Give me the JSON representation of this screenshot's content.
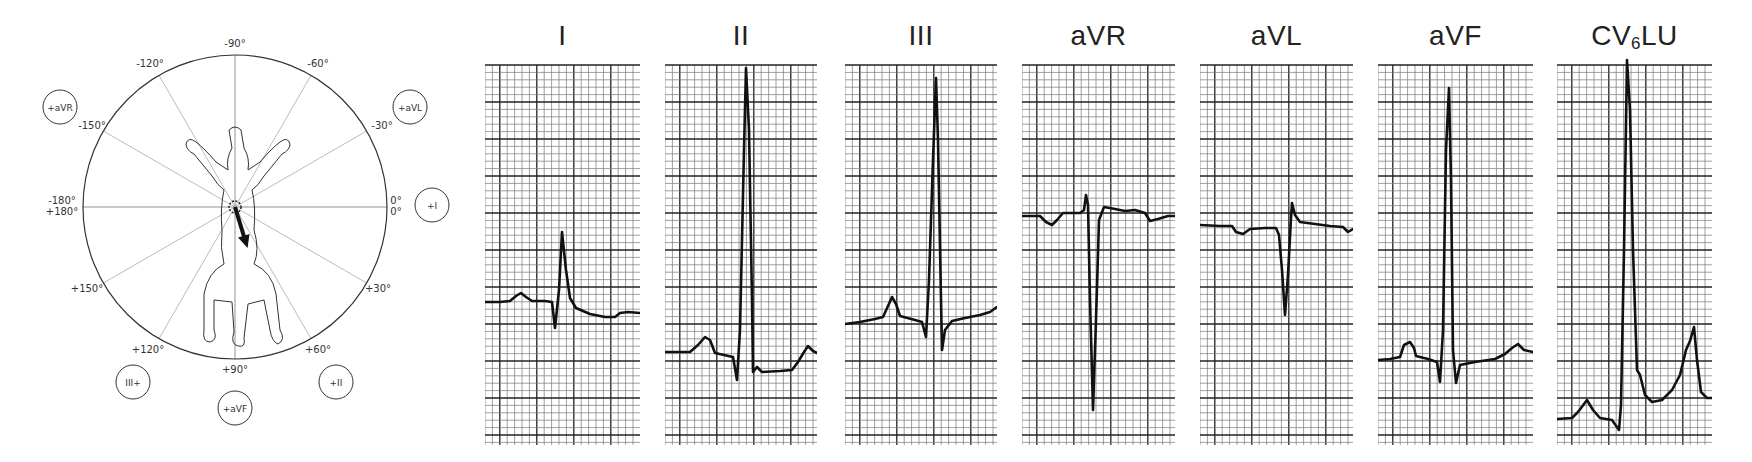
{
  "figure": {
    "type": "canine ECG frontal-plane hexaxial lead system with limb & chest lead tracings",
    "colors": {
      "ink": "#1a1a1a",
      "grid_minor": "#6b6b6b",
      "grid_major": "#2a2a2a",
      "spokes": "#9a9a9a",
      "background": "#ffffff"
    }
  },
  "hexaxial": {
    "center": [
      235,
      207
    ],
    "radius": 152,
    "angle_labels": [
      {
        "text": "-90°",
        "x": 235,
        "y": 47
      },
      {
        "text": "-120°",
        "x": 150,
        "y": 67
      },
      {
        "text": "-60°",
        "x": 318,
        "y": 67
      },
      {
        "text": "-150°",
        "x": 92,
        "y": 129
      },
      {
        "text": "-30°",
        "x": 382,
        "y": 129
      },
      {
        "text": "-180°",
        "x": 62,
        "y": 204
      },
      {
        "text": "+180°",
        "x": 62,
        "y": 215
      },
      {
        "text": "0°",
        "x": 396,
        "y": 204
      },
      {
        "text": "0°",
        "x": 396,
        "y": 215
      },
      {
        "text": "+150°",
        "x": 87,
        "y": 292
      },
      {
        "text": "+30°",
        "x": 378,
        "y": 292
      },
      {
        "text": "+120°",
        "x": 148,
        "y": 353
      },
      {
        "text": "+60°",
        "x": 318,
        "y": 353
      },
      {
        "text": "+90°",
        "x": 235,
        "y": 373
      }
    ],
    "lead_markers": [
      {
        "label": "+aVR",
        "cx": 60,
        "cy": 107,
        "r": 17
      },
      {
        "label": "+aVL",
        "cx": 410,
        "cy": 107,
        "r": 17
      },
      {
        "label": "+I",
        "cx": 432,
        "cy": 205,
        "r": 17
      },
      {
        "label": "III+",
        "cx": 133,
        "cy": 382,
        "r": 17
      },
      {
        "label": "+aVF",
        "cx": 235,
        "cy": 408,
        "r": 17
      },
      {
        "label": "+II",
        "cx": 336,
        "cy": 382,
        "r": 17
      }
    ],
    "mean_electrical_axis": {
      "degrees": 73,
      "description": "arrow from heart toward +II/+aVF"
    }
  },
  "leads": [
    {
      "name": "I",
      "title": "I",
      "grid": {
        "x": 485,
        "y": 65,
        "w": 155,
        "h": 380
      },
      "trace": [
        [
          485,
          302
        ],
        [
          500,
          302
        ],
        [
          510,
          301
        ],
        [
          516,
          296
        ],
        [
          521,
          293
        ],
        [
          526,
          297
        ],
        [
          532,
          301
        ],
        [
          545,
          301
        ],
        [
          552,
          302
        ],
        [
          555,
          328
        ],
        [
          559,
          290
        ],
        [
          562,
          232
        ],
        [
          566,
          270
        ],
        [
          570,
          298
        ],
        [
          576,
          308
        ],
        [
          590,
          314
        ],
        [
          605,
          317
        ],
        [
          615,
          317
        ],
        [
          620,
          313
        ],
        [
          628,
          312
        ],
        [
          640,
          313
        ]
      ]
    },
    {
      "name": "II",
      "title": "II",
      "grid": {
        "x": 665,
        "y": 65,
        "w": 152,
        "h": 380
      },
      "trace": [
        [
          665,
          352
        ],
        [
          680,
          352
        ],
        [
          690,
          352
        ],
        [
          698,
          345
        ],
        [
          705,
          337
        ],
        [
          710,
          340
        ],
        [
          715,
          353
        ],
        [
          733,
          357
        ],
        [
          737,
          380
        ],
        [
          740,
          330
        ],
        [
          744,
          150
        ],
        [
          746,
          68
        ],
        [
          749,
          130
        ],
        [
          752,
          300
        ],
        [
          753,
          372
        ],
        [
          757,
          367
        ],
        [
          762,
          372
        ],
        [
          780,
          371
        ],
        [
          792,
          370
        ],
        [
          798,
          362
        ],
        [
          804,
          352
        ],
        [
          808,
          346
        ],
        [
          813,
          351
        ],
        [
          817,
          353
        ]
      ]
    },
    {
      "name": "III",
      "title": "III",
      "grid": {
        "x": 845,
        "y": 65,
        "w": 152,
        "h": 380
      },
      "trace": [
        [
          845,
          324
        ],
        [
          860,
          322
        ],
        [
          875,
          319
        ],
        [
          883,
          317
        ],
        [
          888,
          306
        ],
        [
          892,
          297
        ],
        [
          896,
          304
        ],
        [
          900,
          316
        ],
        [
          915,
          320
        ],
        [
          922,
          322
        ],
        [
          926,
          337
        ],
        [
          929,
          280
        ],
        [
          933,
          160
        ],
        [
          936,
          78
        ],
        [
          938,
          140
        ],
        [
          941,
          300
        ],
        [
          942,
          350
        ],
        [
          945,
          330
        ],
        [
          952,
          321
        ],
        [
          965,
          318
        ],
        [
          980,
          315
        ],
        [
          990,
          312
        ],
        [
          997,
          307
        ]
      ]
    },
    {
      "name": "aVR",
      "title": "aVR",
      "grid": {
        "x": 1022,
        "y": 65,
        "w": 153,
        "h": 380
      },
      "trace": [
        [
          1022,
          216
        ],
        [
          1040,
          216
        ],
        [
          1046,
          222
        ],
        [
          1052,
          225
        ],
        [
          1057,
          220
        ],
        [
          1063,
          213
        ],
        [
          1080,
          213
        ],
        [
          1084,
          210
        ],
        [
          1086,
          195
        ],
        [
          1088,
          205
        ],
        [
          1090,
          300
        ],
        [
          1093,
          410
        ],
        [
          1096,
          320
        ],
        [
          1099,
          220
        ],
        [
          1104,
          207
        ],
        [
          1115,
          209
        ],
        [
          1125,
          211
        ],
        [
          1135,
          210
        ],
        [
          1145,
          213
        ],
        [
          1150,
          221
        ],
        [
          1158,
          219
        ],
        [
          1168,
          216
        ],
        [
          1175,
          216
        ]
      ]
    },
    {
      "name": "aVL",
      "title": "aVL",
      "grid": {
        "x": 1200,
        "y": 65,
        "w": 153,
        "h": 380
      },
      "trace": [
        [
          1200,
          225
        ],
        [
          1220,
          226
        ],
        [
          1232,
          226
        ],
        [
          1236,
          232
        ],
        [
          1243,
          234
        ],
        [
          1250,
          229
        ],
        [
          1265,
          228
        ],
        [
          1276,
          228
        ],
        [
          1279,
          235
        ],
        [
          1282,
          270
        ],
        [
          1285,
          315
        ],
        [
          1288,
          275
        ],
        [
          1291,
          218
        ],
        [
          1292,
          203
        ],
        [
          1295,
          215
        ],
        [
          1300,
          222
        ],
        [
          1315,
          224
        ],
        [
          1330,
          226
        ],
        [
          1343,
          227
        ],
        [
          1348,
          232
        ],
        [
          1353,
          229
        ]
      ]
    },
    {
      "name": "aVF",
      "title": "aVF",
      "grid": {
        "x": 1378,
        "y": 65,
        "w": 155,
        "h": 380
      },
      "trace": [
        [
          1378,
          360
        ],
        [
          1390,
          359
        ],
        [
          1400,
          357
        ],
        [
          1404,
          345
        ],
        [
          1410,
          342
        ],
        [
          1414,
          348
        ],
        [
          1416,
          356
        ],
        [
          1428,
          359
        ],
        [
          1437,
          362
        ],
        [
          1440,
          382
        ],
        [
          1443,
          330
        ],
        [
          1446,
          150
        ],
        [
          1449,
          88
        ],
        [
          1451,
          180
        ],
        [
          1453,
          350
        ],
        [
          1456,
          383
        ],
        [
          1460,
          365
        ],
        [
          1475,
          362
        ],
        [
          1495,
          359
        ],
        [
          1505,
          354
        ],
        [
          1512,
          348
        ],
        [
          1518,
          344
        ],
        [
          1524,
          350
        ],
        [
          1533,
          352
        ]
      ]
    },
    {
      "name": "CV6LU",
      "title": "CV",
      "subscript": "6",
      "title_suffix": "LU",
      "grid": {
        "x": 1557,
        "y": 65,
        "w": 155,
        "h": 380
      },
      "trace": [
        [
          1557,
          419
        ],
        [
          1572,
          418
        ],
        [
          1578,
          412
        ],
        [
          1587,
          400
        ],
        [
          1593,
          410
        ],
        [
          1600,
          418
        ],
        [
          1612,
          420
        ],
        [
          1619,
          430
        ],
        [
          1621,
          405
        ],
        [
          1624,
          250
        ],
        [
          1627,
          60
        ],
        [
          1630,
          110
        ],
        [
          1633,
          250
        ],
        [
          1637,
          370
        ],
        [
          1640,
          375
        ],
        [
          1645,
          395
        ],
        [
          1652,
          402
        ],
        [
          1662,
          400
        ],
        [
          1672,
          390
        ],
        [
          1680,
          375
        ],
        [
          1686,
          350
        ],
        [
          1690,
          341
        ],
        [
          1694,
          327
        ],
        [
          1697,
          360
        ],
        [
          1701,
          392
        ],
        [
          1707,
          398
        ],
        [
          1712,
          398
        ]
      ]
    }
  ]
}
